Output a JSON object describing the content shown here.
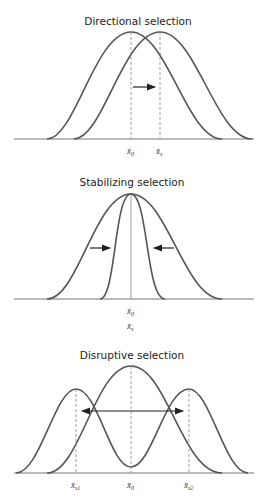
{
  "panels": [
    {
      "title": "Directional selection",
      "labels": {
        "x0": "x̄",
        "x0_sub": "0",
        "xs": "x̄",
        "xs_sub": "s"
      }
    },
    {
      "title": "Stabilizing selection",
      "labels": {
        "x0": "x̄",
        "x0_sub": "0",
        "xs": "x̄",
        "xs_sub": "s"
      }
    },
    {
      "title": "Disruptive selection",
      "labels": {
        "xs1": "x̄",
        "xs1_sub": "s1",
        "x0": "x̄",
        "x0_sub": "0",
        "xs2": "x̄",
        "xs2_sub": "s2"
      }
    }
  ],
  "colors": {
    "curve": "#555555",
    "arrow": "#222222"
  }
}
